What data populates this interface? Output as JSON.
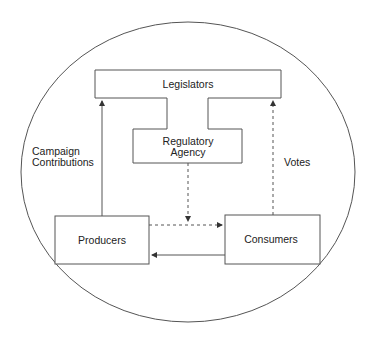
{
  "diagram": {
    "boundary": "economy-circle",
    "nodes": {
      "legislators": {
        "label": "Legislators"
      },
      "regulatory_agency": {
        "label_lines": [
          "Regulatory",
          "Agency"
        ]
      },
      "producers": {
        "label": "Producers"
      },
      "consumers": {
        "label": "Consumers"
      }
    },
    "edges": [
      {
        "from": "producers",
        "to": "legislators",
        "style": "solid",
        "label_lines": [
          "Campaign",
          "Contributions"
        ]
      },
      {
        "from": "consumers",
        "to": "legislators",
        "style": "dashed",
        "label": "Votes"
      },
      {
        "from": "regulatory_agency",
        "to": "producers-consumers-link",
        "style": "dashed"
      },
      {
        "from": "producers",
        "to": "consumers",
        "style": "dashed"
      },
      {
        "from": "consumers",
        "to": "producers",
        "style": "solid"
      }
    ]
  },
  "colors": {
    "line": "#555555",
    "text": "#222222",
    "background": "#ffffff"
  }
}
